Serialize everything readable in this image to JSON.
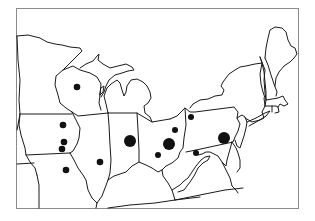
{
  "map": {
    "title": "",
    "region": "Midwest and Northeastern United States",
    "colors": {
      "background": "#ffffff",
      "border": "#1a1a1a",
      "frame": "#8a8a8a",
      "marker": "#111111"
    },
    "markers": [
      {
        "id": "wisconsin",
        "x": 77,
        "y": 87,
        "r": 3.3,
        "size": "small"
      },
      {
        "id": "iowa-north",
        "x": 63,
        "y": 125,
        "r": 3.3,
        "size": "small"
      },
      {
        "id": "iowa-central",
        "x": 64,
        "y": 142,
        "r": 3.3,
        "size": "small"
      },
      {
        "id": "iowa-south",
        "x": 62,
        "y": 149,
        "r": 3.3,
        "size": "small"
      },
      {
        "id": "missouri",
        "x": 66,
        "y": 170,
        "r": 3.3,
        "size": "small"
      },
      {
        "id": "illinois",
        "x": 100,
        "y": 162,
        "r": 3.3,
        "size": "small"
      },
      {
        "id": "indiana",
        "x": 130,
        "y": 141,
        "r": 6,
        "size": "large"
      },
      {
        "id": "ohio-northwest",
        "x": 175,
        "y": 130,
        "r": 3,
        "size": "small"
      },
      {
        "id": "ohio-central",
        "x": 169,
        "y": 144,
        "r": 6,
        "size": "large"
      },
      {
        "id": "ohio-south",
        "x": 158,
        "y": 155,
        "r": 3,
        "size": "small"
      },
      {
        "id": "pennsylvania-erie",
        "x": 191,
        "y": 117,
        "r": 3,
        "size": "small"
      },
      {
        "id": "pennsylvania-east",
        "x": 224,
        "y": 138,
        "r": 6,
        "size": "large"
      },
      {
        "id": "pennsylvania-south",
        "x": 196,
        "y": 153,
        "r": 3,
        "size": "small"
      }
    ]
  }
}
